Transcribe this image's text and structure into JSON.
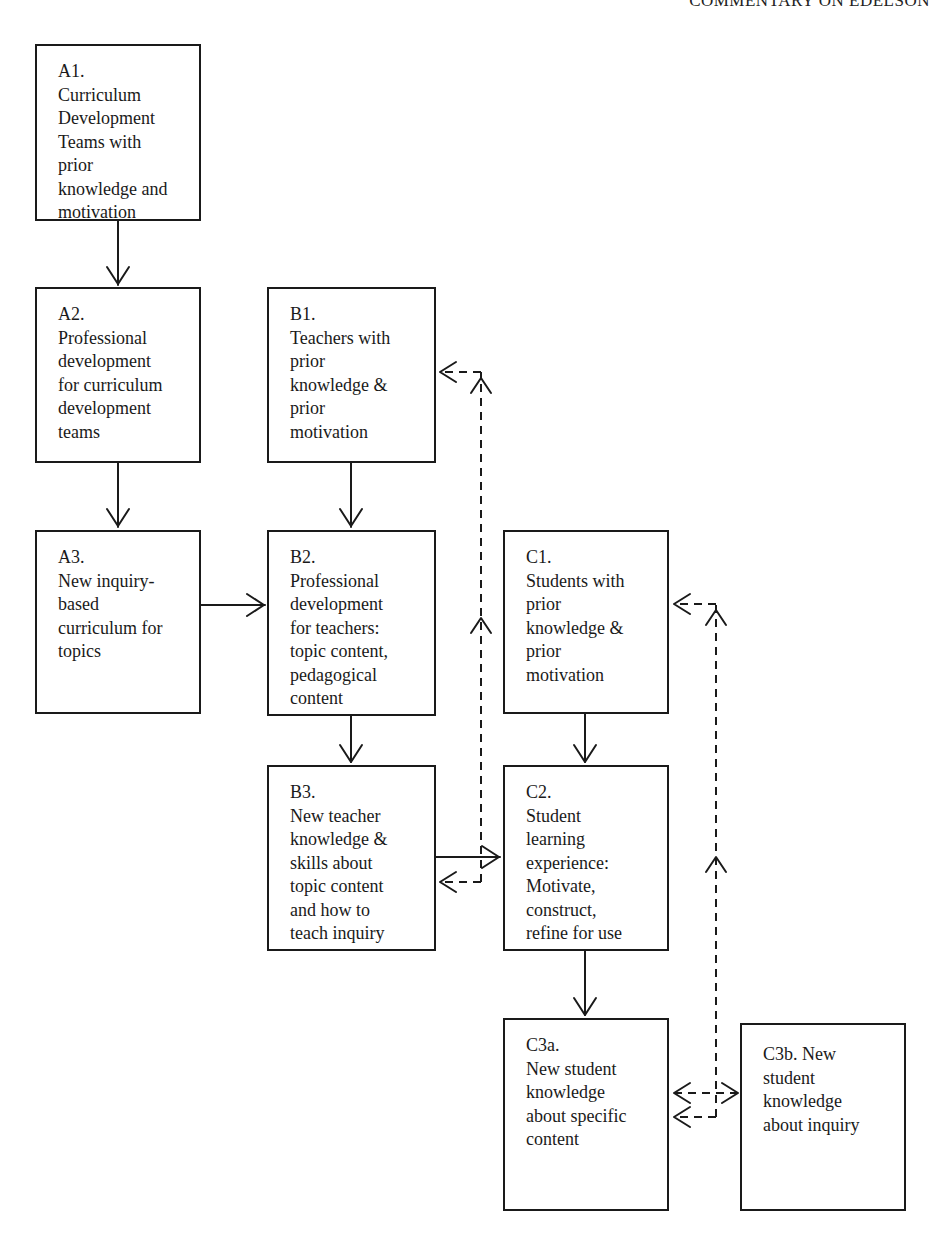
{
  "header": {
    "running_head": "COMMENTARY ON EDELSON"
  },
  "diagram": {
    "nodes": [
      {
        "id": "A1",
        "label": "A1.",
        "text": "Curriculum\nDevelopment\nTeams with\nprior\nknowledge and\nmotivation"
      },
      {
        "id": "A2",
        "label": "A2.",
        "text": "Professional\ndevelopment\nfor curriculum\ndevelopment\nteams"
      },
      {
        "id": "A3",
        "label": "A3.",
        "text": "New inquiry-\nbased\ncurriculum for\ntopics"
      },
      {
        "id": "B1",
        "label": "B1.",
        "text": "Teachers with\nprior\nknowledge &\nprior\nmotivation"
      },
      {
        "id": "B2",
        "label": "B2.",
        "text": "Professional\ndevelopment\nfor teachers:\ntopic content,\npedagogical\ncontent"
      },
      {
        "id": "B3",
        "label": "B3.",
        "text": "New teacher\nknowledge &\nskills about\ntopic content\nand how to\nteach inquiry"
      },
      {
        "id": "C1",
        "label": "C1.",
        "text": "Students with\nprior\nknowledge &\nprior\nmotivation"
      },
      {
        "id": "C2",
        "label": "C2.",
        "text": "Student\nlearning\nexperience:\nMotivate,\nconstruct,\nrefine for use"
      },
      {
        "id": "C3a",
        "label": "C3a.",
        "text": "New student\nknowledge\nabout specific\ncontent"
      },
      {
        "id": "C3b",
        "label": "C3b. New",
        "text": "student\nknowledge\nabout inquiry"
      }
    ],
    "edges": [
      {
        "from": "A1",
        "to": "A2",
        "style": "solid"
      },
      {
        "from": "A2",
        "to": "A3",
        "style": "solid"
      },
      {
        "from": "A3",
        "to": "B2",
        "style": "solid"
      },
      {
        "from": "B1",
        "to": "B2",
        "style": "solid"
      },
      {
        "from": "B2",
        "to": "B3",
        "style": "solid"
      },
      {
        "from": "B3",
        "to": "C2",
        "style": "solid"
      },
      {
        "from": "C1",
        "to": "C2",
        "style": "solid"
      },
      {
        "from": "C2",
        "to": "C3a",
        "style": "solid"
      },
      {
        "from": "B3",
        "to": "B1",
        "style": "dashed"
      },
      {
        "from": "B3",
        "to": "B3",
        "style": "dashed"
      },
      {
        "from": "C3a",
        "to": "C1",
        "style": "dashed"
      },
      {
        "from": "C3a",
        "to": "C3b",
        "style": "dashed"
      },
      {
        "from": "C3a",
        "to": "C3a",
        "style": "dashed"
      }
    ],
    "colors": {
      "line": "#1a1a1a",
      "background": "#ffffff"
    }
  }
}
